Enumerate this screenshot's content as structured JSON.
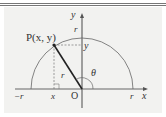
{
  "diagram": {
    "point_label": "P(x, y)",
    "y_axis_label": "y",
    "x_axis_label": "x",
    "origin_label": "O",
    "radius_label": "r",
    "angle_label": "θ",
    "top_r_label": "r",
    "point_y_label": "y",
    "point_x_label": "x",
    "neg_r_label": "−r",
    "pos_r_label": "r"
  }
}
